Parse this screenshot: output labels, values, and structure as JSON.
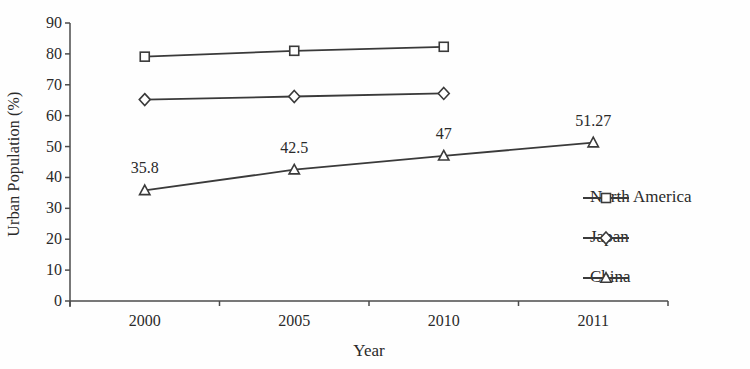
{
  "chart_data": {
    "type": "line",
    "title": "",
    "xlabel": "Year",
    "ylabel": "Urban Population (%)",
    "ylim": [
      0,
      90
    ],
    "yticks": [
      0,
      10,
      20,
      30,
      40,
      50,
      60,
      70,
      80,
      90
    ],
    "categories": [
      "2000",
      "2005",
      "2010",
      "2011"
    ],
    "grid": false,
    "legend_position": "right",
    "line_color": "#3a3a3a",
    "axis_color": "#4b4b4b",
    "marker_fill": "#ffffff",
    "series": [
      {
        "name": "North America",
        "marker": "square",
        "values": [
          79.1,
          81.0,
          82.3,
          null
        ],
        "point_labels": [
          null,
          null,
          null,
          null
        ]
      },
      {
        "name": "Japan",
        "marker": "diamond",
        "values": [
          65.2,
          66.2,
          67.2,
          null
        ],
        "point_labels": [
          null,
          null,
          null,
          null
        ]
      },
      {
        "name": "China",
        "marker": "triangle",
        "values": [
          35.8,
          42.5,
          47,
          51.27
        ],
        "point_labels": [
          "35.8",
          "42.5",
          "47",
          "51.27"
        ]
      }
    ]
  }
}
